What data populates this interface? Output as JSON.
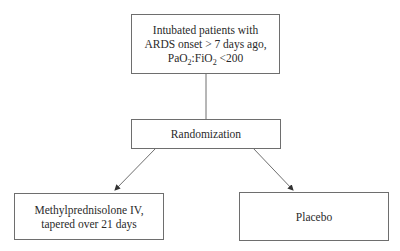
{
  "diagram": {
    "type": "flowchart",
    "nodes": {
      "eligibility": {
        "lines": [
          "Intubated patients with",
          "ARDS onset > 7 days ago,"
        ],
        "ratio": {
          "a": "PaO",
          "a_sub": "2",
          "sep": ":FiO",
          "b_sub": "2",
          "rest": " <200"
        }
      },
      "randomization": {
        "label": "Randomization"
      },
      "treatment": {
        "lines": [
          "Methylprednisolone IV,",
          "tapered over 21 days"
        ]
      },
      "control": {
        "label": "Placebo"
      }
    },
    "edges": [
      {
        "from": "eligibility",
        "to": "randomization",
        "style": "line"
      },
      {
        "from": "randomization",
        "to": "treatment",
        "style": "arrow"
      },
      {
        "from": "randomization",
        "to": "control",
        "style": "arrow"
      }
    ],
    "colors": {
      "stroke": "#6e6e6e",
      "text": "#2a2a2a",
      "background": "#ffffff"
    }
  }
}
